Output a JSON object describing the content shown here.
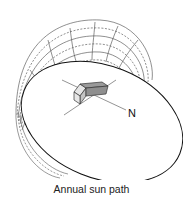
{
  "caption": "Annual sun path",
  "north_label": "N",
  "colors": {
    "line": "#222222",
    "thin_line": "#555555",
    "roof": "#9a9a9a",
    "wall_light": "#e6e6e6",
    "wall_dark": "#c4c4c4"
  }
}
